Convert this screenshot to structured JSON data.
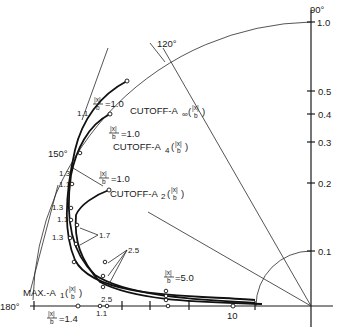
{
  "figure": {
    "type": "polar plot",
    "angle_labels": {
      "a90": "90°",
      "a120": "120°",
      "a150": "150°",
      "a180": "180°"
    },
    "radial_ticks": [
      "1.0",
      "0.5",
      "0.4",
      "0.3",
      "0.2",
      "0.1"
    ],
    "horizontal_tick_label": "10",
    "curves": {
      "cutoff_inf": {
        "label": "CUTOFF-A",
        "sub": "∞",
        "arg": "(|x|/b)",
        "start_label": "=1.0"
      },
      "cutoff_4": {
        "label": "CUTOFF-A",
        "sub": "4",
        "arg": "(|x|/b)",
        "start_label": "=1.0"
      },
      "cutoff_2": {
        "label": "CUTOFF-A",
        "sub": "2",
        "arg": "(|x|/b)",
        "start_label": "=1.0"
      },
      "max_1": {
        "label": "MAX.-A",
        "sub": "1",
        "arg": "(|x|/b)",
        "start_label": "=1.4"
      }
    },
    "frac": {
      "num": "|x|",
      "den": "b"
    },
    "point_labels": {
      "p11a": "1.1",
      "p13a": "1.3",
      "p11b": "1.1",
      "p13b": "1.3",
      "p11c": "1.1",
      "p13c": "1.3",
      "p17": "1.7",
      "p25": "2.5",
      "p50": "=5.0",
      "p25axis": "2.5",
      "p11axis": "1.1"
    }
  }
}
